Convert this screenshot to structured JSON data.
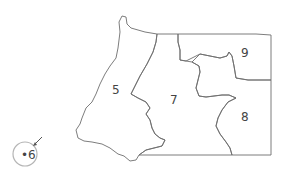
{
  "map": {
    "regions": [
      {
        "id": "5",
        "label": "5"
      },
      {
        "id": "7",
        "label": "7"
      },
      {
        "id": "8",
        "label": "8"
      },
      {
        "id": "9",
        "label": "9"
      },
      {
        "id": "6",
        "label": "•6"
      }
    ],
    "colors": {
      "border": "#6e6e6e",
      "label": "#444444",
      "highlight_circle": "#b5b5b5"
    }
  }
}
